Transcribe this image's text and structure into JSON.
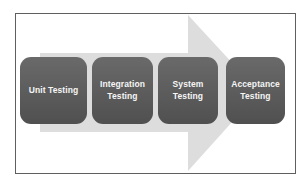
{
  "diagram": {
    "type": "process-flow",
    "arrow": {
      "direction": "right"
    },
    "stages": [
      {
        "label": "Unit Testing"
      },
      {
        "label": "Integration Testing"
      },
      {
        "label": "System Testing"
      },
      {
        "label": "Acceptance Testing"
      }
    ],
    "colors": {
      "stage_box": "#5b5b5b",
      "stage_text": "#f6f6f6",
      "frame_border": "#5f5f5f",
      "arrow_fill": "#dddddd",
      "background": "#ffffff"
    }
  }
}
